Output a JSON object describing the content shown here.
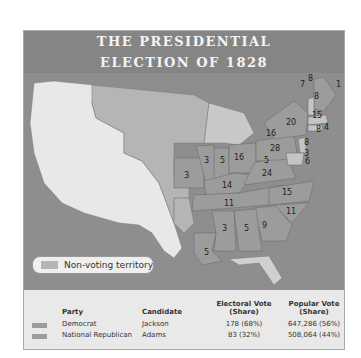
{
  "title": {
    "line1": "THE PRESIDENTIAL",
    "line2": "ELECTION OF 1828"
  },
  "legend": {
    "non_voting_label": "Non-voting territory",
    "non_voting_color": "#b5b5b5"
  },
  "colors": {
    "frame": "#8e8e8e",
    "water": "#8e8e8e",
    "unorganized": "#e8e8e8",
    "non_voting": "#b5b5b5",
    "democrat": "#9c9c9c",
    "national_republican": "#c4c4c4"
  },
  "electoral_votes": {
    "ME": "1",
    "ME2": "8",
    "NH": "8",
    "VT": "7",
    "MA": "15",
    "RI": "4",
    "CT": "8",
    "NY": "20",
    "NY2": "16",
    "PA": "28",
    "NJ": "8",
    "DE": "3",
    "MD": "6",
    "MD2": "5",
    "VA": "24",
    "NC": "15",
    "SC": "11",
    "GA": "9",
    "AL": "5",
    "MS": "3",
    "LA": "5",
    "TN": "11",
    "KY": "14",
    "OH": "16",
    "IN": "5",
    "IL": "3",
    "MO": "3"
  },
  "table": {
    "headers": {
      "party": "Party",
      "candidate": "Candidate",
      "electoral_1": "Electoral Vote",
      "electoral_2": "(Share)",
      "popular_1": "Popular Vote",
      "popular_2": "(Share)"
    },
    "rows": [
      {
        "party": "Democrat",
        "candidate": "Jackson",
        "electoral": "178 (68%)",
        "popular": "647,286 (56%)",
        "color": "#9c9c9c"
      },
      {
        "party": "National Republican",
        "candidate": "Adams",
        "electoral": "83 (32%)",
        "popular": "508,064 (44%)",
        "color": "#9c9c9c"
      }
    ]
  }
}
